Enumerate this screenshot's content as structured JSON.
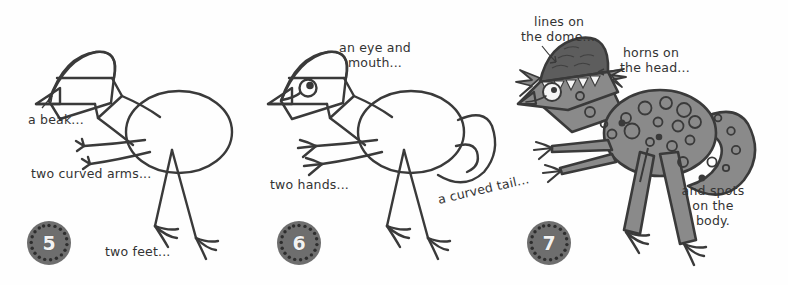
{
  "document": {
    "kind": "how-to-draw-instruction-strip",
    "subject": "dinosaur",
    "background_color": "#fefefe",
    "ink_color": "#3a3a3a",
    "fill_gray": "#8a8a8a",
    "dome_gray": "#5d5d5d",
    "badge_color": "#6e6e6e",
    "badge_text_color": "#f2f2f2"
  },
  "panels": [
    {
      "step_number": "5",
      "badge_name": "step-badge-5",
      "captions": [
        {
          "text": "a beak...",
          "name": "caption-a-beak"
        },
        {
          "text": "two curved arms...",
          "name": "caption-two-curved-arms"
        },
        {
          "text": "two feet...",
          "name": "caption-two-feet"
        }
      ],
      "drawing_parts": [
        "head-outline",
        "beak",
        "neck",
        "body-oval",
        "two-curved-arms",
        "two-legs",
        "two-feet"
      ]
    },
    {
      "step_number": "6",
      "badge_name": "step-badge-6",
      "captions": [
        {
          "text": "an eye and",
          "name": "caption-an-eye-and"
        },
        {
          "text": "mouth...",
          "name": "caption-mouth"
        },
        {
          "text": "two hands...",
          "name": "caption-two-hands"
        },
        {
          "text": "a curved tail...",
          "name": "caption-a-curved-tail"
        }
      ],
      "drawing_parts": [
        "head-outline",
        "eye",
        "mouth",
        "body-oval",
        "two-hands",
        "two-legs",
        "two-feet",
        "curved-tail"
      ]
    },
    {
      "step_number": "7",
      "badge_name": "step-badge-7",
      "captions": [
        {
          "text": "lines on",
          "name": "caption-lines-on"
        },
        {
          "text": "the dome...",
          "name": "caption-the-dome"
        },
        {
          "text": "horns on",
          "name": "caption-horns-on"
        },
        {
          "text": "the head...",
          "name": "caption-the-head"
        },
        {
          "text": "and spots",
          "name": "caption-and-spots"
        },
        {
          "text": "on the",
          "name": "caption-on-the"
        },
        {
          "text": "body.",
          "name": "caption-body"
        }
      ],
      "drawing_parts": [
        "dome-with-lines",
        "horns",
        "eye",
        "mouth",
        "filled-body",
        "spots",
        "curved-tail",
        "two-hands",
        "two-feet"
      ]
    }
  ]
}
